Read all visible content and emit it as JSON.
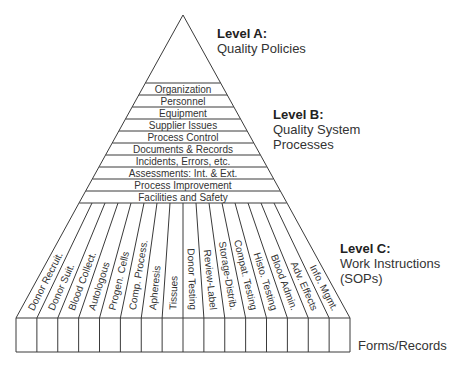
{
  "levels": {
    "a": {
      "title": "Level A:",
      "subtitle_lines": [
        "Quality Policies"
      ]
    },
    "b": {
      "title": "Level B:",
      "subtitle_lines": [
        "Quality System",
        "Processes"
      ]
    },
    "c": {
      "title": "Level C:",
      "subtitle_lines": [
        "Work Instructions",
        "(SOPs)"
      ]
    }
  },
  "bands": [
    "Organization",
    "Personnel",
    "Equipment",
    "Supplier Issues",
    "Process Control",
    "Documents & Records",
    "Incidents, Errors, etc.",
    "Assessments: Int. & Ext.",
    "Process Improvement",
    "Facilities and Safety"
  ],
  "columns": [
    "Donor Recruit.",
    "Donor Suit.",
    "Blood Collect.",
    "Autologous",
    "Progen. Cells",
    "Comp. Process.",
    "Apheresis",
    "Tissues",
    "Donor Testing",
    "Review-Label",
    "Storage-Distrib.",
    "Compat. Testing",
    "Histo. Testing",
    "Blood Admin.",
    "Adv. Effects",
    "Info. Mgmt."
  ],
  "forms_label": "Forms/Records",
  "colors": {
    "line": "#3a3a3a",
    "text": "#333333",
    "background": "#ffffff"
  }
}
